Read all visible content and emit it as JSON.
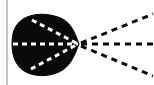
{
  "figure": {
    "title": "Directional lobe pattern with converging dashed rays",
    "type": "diagram",
    "canvas": {
      "width": 154,
      "height": 85,
      "background_color": "#ffffff"
    },
    "colors": {
      "ink": "#0a0a0a",
      "paper": "#ffffff",
      "dash_light": "#ffffff",
      "dash_dark": "#0a0a0a",
      "margin_rule": "#8c8c8c"
    },
    "margin_rule": {
      "name": "page-margin-line",
      "x": 7,
      "y_start": 0,
      "y_end": 85,
      "width": 1,
      "color": "#8c8c8c"
    },
    "lobe": {
      "name": "main-lobe-blob",
      "description": "solid black cardioid / heart-shaped lobe filled with ink",
      "fill": "#0a0a0a",
      "bounds": {
        "x_min": 12,
        "x_max": 80,
        "y_min": 14,
        "y_max": 77
      },
      "apex": {
        "x": 79,
        "y": 44
      },
      "path": "M 79 44 C 74 30 70 21 58 17 C 46 13 33 13 23 19 C 14 25 12 34 12 44 C 12 55 15 65 24 71 C 34 77 48 77 59 72 C 70 67 74 57 79 44 Z"
    },
    "convergence_point": {
      "name": "focus-point",
      "x": 79,
      "y": 44
    },
    "inner_rays": [
      {
        "name": "inner-ray-upper",
        "style": "white-dashed",
        "from": {
          "x": 32,
          "y": 20
        },
        "to": {
          "x": 78,
          "y": 44
        },
        "color": "#ffffff",
        "stroke_width": 3,
        "dash": "5 4"
      },
      {
        "name": "inner-ray-axis",
        "style": "white-dashed",
        "from": {
          "x": 13,
          "y": 44
        },
        "to": {
          "x": 78,
          "y": 44
        },
        "color": "#ffffff",
        "stroke_width": 3,
        "dash": "5 4"
      },
      {
        "name": "inner-ray-lower",
        "style": "white-dashed",
        "from": {
          "x": 31,
          "y": 69
        },
        "to": {
          "x": 78,
          "y": 44
        },
        "color": "#ffffff",
        "stroke_width": 3,
        "dash": "5 4"
      }
    ],
    "outer_rays": [
      {
        "name": "outer-ray-upper",
        "style": "black-dashed",
        "from": {
          "x": 81,
          "y": 43
        },
        "to": {
          "x": 153,
          "y": 14
        },
        "color": "#0a0a0a",
        "stroke_width": 3,
        "dash": "6 5"
      },
      {
        "name": "outer-ray-axis",
        "style": "black-dashed",
        "from": {
          "x": 81,
          "y": 44
        },
        "to": {
          "x": 154,
          "y": 44
        },
        "color": "#0a0a0a",
        "stroke_width": 3,
        "dash": "6 5"
      },
      {
        "name": "outer-ray-lower",
        "style": "black-dashed",
        "from": {
          "x": 81,
          "y": 46
        },
        "to": {
          "x": 153,
          "y": 76
        },
        "color": "#0a0a0a",
        "stroke_width": 3,
        "dash": "6 5"
      }
    ],
    "labels": []
  }
}
